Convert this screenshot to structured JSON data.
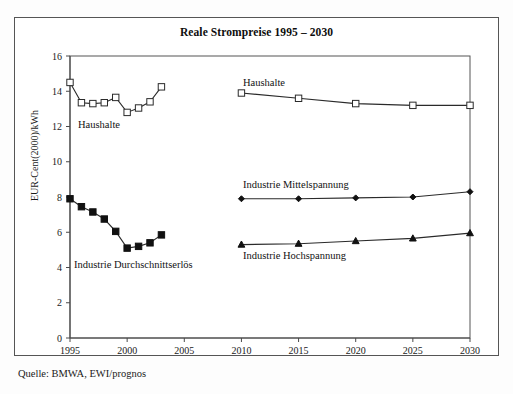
{
  "figure": {
    "title": "Reale Strompreise 1995 – 2030",
    "source_note": "Quelle: BMWA, EWI/prognos"
  },
  "annotations": {
    "haushalte_hist": "Haushalte",
    "haushalte_forecast": "Haushalte",
    "industrie_durchschnitt": "Industrie Durchschnittserlös",
    "industrie_mittel": "Industrie Mittelspannung",
    "industrie_hoch": "Industrie Hochspannung"
  },
  "chart_data": {
    "type": "line",
    "title": "Reale Strompreise 1995 – 2030",
    "xlabel": "",
    "ylabel": "EUR-Cent(2000)/kWh",
    "xlim": [
      1995,
      2030
    ],
    "ylim": [
      0,
      16
    ],
    "ytick_labels": [
      "0",
      "2",
      "4",
      "6",
      "8",
      "10",
      "12",
      "14",
      "16"
    ],
    "yticks": [
      0,
      2,
      4,
      6,
      8,
      10,
      12,
      14,
      16
    ],
    "xtick_labels": [
      "1995",
      "2000",
      "2005",
      "2010",
      "2015",
      "2020",
      "2025",
      "2030"
    ],
    "xticks": [
      1995,
      2000,
      2005,
      2010,
      2015,
      2020,
      2025,
      2030
    ],
    "grid": false,
    "legend_position": "inline-annotations",
    "series": [
      {
        "name": "Haushalte (historisch)",
        "marker": "open-square",
        "x": [
          1995,
          1996,
          1997,
          1998,
          1999,
          2000,
          2001,
          2002,
          2003
        ],
        "values": [
          14.5,
          13.35,
          13.3,
          13.35,
          13.65,
          12.8,
          13.05,
          13.4,
          14.25
        ]
      },
      {
        "name": "Industrie Durchschnittserlös (historisch)",
        "marker": "filled-square",
        "x": [
          1995,
          1996,
          1997,
          1998,
          1999,
          2000,
          2001,
          2002,
          2003
        ],
        "values": [
          7.9,
          7.45,
          7.15,
          6.75,
          6.05,
          5.1,
          5.2,
          5.4,
          5.85
        ]
      },
      {
        "name": "Haushalte (Prognose)",
        "marker": "open-square",
        "x": [
          2010,
          2015,
          2020,
          2025,
          2030
        ],
        "values": [
          13.9,
          13.6,
          13.3,
          13.2,
          13.2
        ]
      },
      {
        "name": "Industrie Mittelspannung (Prognose)",
        "marker": "filled-diamond",
        "x": [
          2010,
          2015,
          2020,
          2025,
          2030
        ],
        "values": [
          7.9,
          7.9,
          7.95,
          8.0,
          8.3
        ]
      },
      {
        "name": "Industrie Hochspannung (Prognose)",
        "marker": "filled-triangle",
        "x": [
          2010,
          2015,
          2020,
          2025,
          2030
        ],
        "values": [
          5.3,
          5.35,
          5.5,
          5.65,
          5.95
        ]
      }
    ]
  },
  "colors": {
    "line": "#2a2a2a",
    "marker_fill_open": "#ffffff",
    "marker_fill_solid": "#111111",
    "axis": "#4a4a4a",
    "frame": "#555555",
    "background": "#ffffff"
  }
}
